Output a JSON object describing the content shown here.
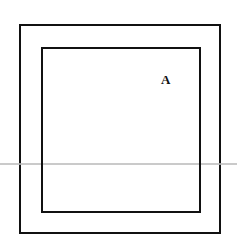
{
  "diagram": {
    "type": "nested-squares",
    "shapes": [
      {
        "id": "outer-square",
        "x": 19,
        "y": 24,
        "width": 202,
        "height": 210
      },
      {
        "id": "inner-square",
        "x": 41,
        "y": 47,
        "width": 160,
        "height": 166
      }
    ],
    "labels": [
      {
        "id": "region-label",
        "text": "A",
        "x": 161,
        "y": 72
      }
    ],
    "stroke_color": "#111111"
  }
}
